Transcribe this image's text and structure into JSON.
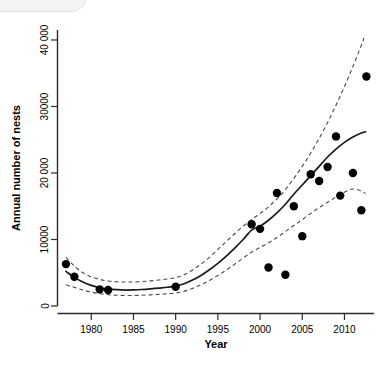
{
  "figure": {
    "background_color": "#ffffff",
    "point_color": "#000000",
    "fit_color": "#1a1a1a",
    "ci_color": "#4a4a4a"
  },
  "artifact": {
    "name": "rounded-overlay-corner",
    "color": "#f4f4f4"
  },
  "chart_data": {
    "type": "scatter",
    "title": "",
    "xlabel": "Year",
    "ylabel": "Annual number of nests",
    "xlim": [
      1976,
      2013.5
    ],
    "ylim": [
      0,
      41500
    ],
    "grid": false,
    "legend": "none",
    "xticks": [
      1980,
      1985,
      1990,
      1995,
      2000,
      2005,
      2010
    ],
    "xticklabels": [
      "1980",
      "1985",
      "1990",
      "1995",
      "2000",
      "2005",
      "2010"
    ],
    "yticks": [
      0,
      10000,
      20000,
      30000,
      40000
    ],
    "yticklabels": [
      "0",
      "10000",
      "20 000",
      "30000",
      "40 000"
    ],
    "series": [
      {
        "name": "Annual number of nests",
        "type": "scatter",
        "marker": "filled-circle",
        "color": "#000000",
        "points": [
          {
            "x": 1977,
            "y": 6300
          },
          {
            "x": 1978,
            "y": 4400
          },
          {
            "x": 1981,
            "y": 2500
          },
          {
            "x": 1982,
            "y": 2400
          },
          {
            "x": 1990,
            "y": 2900
          },
          {
            "x": 1999,
            "y": 12300
          },
          {
            "x": 2000,
            "y": 11600
          },
          {
            "x": 2001,
            "y": 5800
          },
          {
            "x": 2002,
            "y": 17000
          },
          {
            "x": 2003,
            "y": 4700
          },
          {
            "x": 2004,
            "y": 15000
          },
          {
            "x": 2005,
            "y": 10500
          },
          {
            "x": 2006,
            "y": 19800
          },
          {
            "x": 2007,
            "y": 18800
          },
          {
            "x": 2008,
            "y": 20900
          },
          {
            "x": 2009,
            "y": 25500
          },
          {
            "x": 2009.5,
            "y": 16600
          },
          {
            "x": 2011,
            "y": 20000
          },
          {
            "x": 2012,
            "y": 14400
          },
          {
            "x": 2012.6,
            "y": 34500
          }
        ]
      },
      {
        "name": "Fitted trend",
        "type": "line",
        "style": "solid",
        "color": "#1a1a1a",
        "points": [
          {
            "x": 1977,
            "y": 5200
          },
          {
            "x": 1978,
            "y": 4300
          },
          {
            "x": 1979,
            "y": 3600
          },
          {
            "x": 1980,
            "y": 3100
          },
          {
            "x": 1981,
            "y": 2750
          },
          {
            "x": 1982,
            "y": 2550
          },
          {
            "x": 1983,
            "y": 2450
          },
          {
            "x": 1984,
            "y": 2400
          },
          {
            "x": 1985,
            "y": 2420
          },
          {
            "x": 1986,
            "y": 2480
          },
          {
            "x": 1987,
            "y": 2580
          },
          {
            "x": 1988,
            "y": 2700
          },
          {
            "x": 1989,
            "y": 2820
          },
          {
            "x": 1990,
            "y": 3000
          },
          {
            "x": 1991,
            "y": 3350
          },
          {
            "x": 1992,
            "y": 3900
          },
          {
            "x": 1993,
            "y": 4600
          },
          {
            "x": 1994,
            "y": 5450
          },
          {
            "x": 1995,
            "y": 6400
          },
          {
            "x": 1996,
            "y": 7500
          },
          {
            "x": 1997,
            "y": 8700
          },
          {
            "x": 1998,
            "y": 10000
          },
          {
            "x": 1999,
            "y": 11400
          },
          {
            "x": 2000,
            "y": 12000
          },
          {
            "x": 2001,
            "y": 12900
          },
          {
            "x": 2002,
            "y": 14000
          },
          {
            "x": 2003,
            "y": 15300
          },
          {
            "x": 2004,
            "y": 16800
          },
          {
            "x": 2005,
            "y": 18200
          },
          {
            "x": 2006,
            "y": 19600
          },
          {
            "x": 2007,
            "y": 21000
          },
          {
            "x": 2008,
            "y": 22400
          },
          {
            "x": 2009,
            "y": 23600
          },
          {
            "x": 2010,
            "y": 24600
          },
          {
            "x": 2011,
            "y": 25400
          },
          {
            "x": 2012,
            "y": 26000
          },
          {
            "x": 2012.5,
            "y": 26200
          }
        ]
      },
      {
        "name": "Upper confidence band",
        "type": "line",
        "style": "dashed",
        "color": "#4a4a4a",
        "points": [
          {
            "x": 1977,
            "y": 7300
          },
          {
            "x": 1978,
            "y": 6000
          },
          {
            "x": 1979,
            "y": 5000
          },
          {
            "x": 1980,
            "y": 4400
          },
          {
            "x": 1981,
            "y": 4000
          },
          {
            "x": 1982,
            "y": 3750
          },
          {
            "x": 1983,
            "y": 3650
          },
          {
            "x": 1984,
            "y": 3600
          },
          {
            "x": 1985,
            "y": 3620
          },
          {
            "x": 1986,
            "y": 3680
          },
          {
            "x": 1987,
            "y": 3780
          },
          {
            "x": 1988,
            "y": 3900
          },
          {
            "x": 1989,
            "y": 4050
          },
          {
            "x": 1990,
            "y": 4250
          },
          {
            "x": 1991,
            "y": 4700
          },
          {
            "x": 1992,
            "y": 5400
          },
          {
            "x": 1993,
            "y": 6300
          },
          {
            "x": 1994,
            "y": 7300
          },
          {
            "x": 1995,
            "y": 8500
          },
          {
            "x": 1996,
            "y": 9700
          },
          {
            "x": 1997,
            "y": 10900
          },
          {
            "x": 1998,
            "y": 12000
          },
          {
            "x": 1999,
            "y": 13000
          },
          {
            "x": 2000,
            "y": 13900
          },
          {
            "x": 2001,
            "y": 14900
          },
          {
            "x": 2002,
            "y": 16100
          },
          {
            "x": 2003,
            "y": 17500
          },
          {
            "x": 2004,
            "y": 19200
          },
          {
            "x": 2005,
            "y": 21000
          },
          {
            "x": 2006,
            "y": 23000
          },
          {
            "x": 2007,
            "y": 25200
          },
          {
            "x": 2008,
            "y": 27600
          },
          {
            "x": 2009,
            "y": 30200
          },
          {
            "x": 2010,
            "y": 33000
          },
          {
            "x": 2011,
            "y": 36000
          },
          {
            "x": 2012,
            "y": 39200
          },
          {
            "x": 2012.3,
            "y": 40300
          }
        ]
      },
      {
        "name": "Lower confidence band",
        "type": "line",
        "style": "dashed",
        "color": "#4a4a4a",
        "points": [
          {
            "x": 1977,
            "y": 3200
          },
          {
            "x": 1978,
            "y": 2800
          },
          {
            "x": 1979,
            "y": 2400
          },
          {
            "x": 1980,
            "y": 2100
          },
          {
            "x": 1981,
            "y": 1850
          },
          {
            "x": 1982,
            "y": 1700
          },
          {
            "x": 1983,
            "y": 1620
          },
          {
            "x": 1984,
            "y": 1580
          },
          {
            "x": 1985,
            "y": 1580
          },
          {
            "x": 1986,
            "y": 1620
          },
          {
            "x": 1987,
            "y": 1680
          },
          {
            "x": 1988,
            "y": 1750
          },
          {
            "x": 1989,
            "y": 1830
          },
          {
            "x": 1990,
            "y": 1950
          },
          {
            "x": 1991,
            "y": 2200
          },
          {
            "x": 1992,
            "y": 2650
          },
          {
            "x": 1993,
            "y": 3200
          },
          {
            "x": 1994,
            "y": 3850
          },
          {
            "x": 1995,
            "y": 4600
          },
          {
            "x": 1996,
            "y": 5400
          },
          {
            "x": 1997,
            "y": 6300
          },
          {
            "x": 1998,
            "y": 7200
          },
          {
            "x": 1999,
            "y": 8100
          },
          {
            "x": 2000,
            "y": 8800
          },
          {
            "x": 2001,
            "y": 9500
          },
          {
            "x": 2002,
            "y": 10300
          },
          {
            "x": 2003,
            "y": 11200
          },
          {
            "x": 2004,
            "y": 12100
          },
          {
            "x": 2005,
            "y": 13000
          },
          {
            "x": 2006,
            "y": 13900
          },
          {
            "x": 2007,
            "y": 14800
          },
          {
            "x": 2008,
            "y": 15600
          },
          {
            "x": 2009,
            "y": 16400
          },
          {
            "x": 2010,
            "y": 17100
          },
          {
            "x": 2011,
            "y": 17600
          },
          {
            "x": 2012,
            "y": 17300
          },
          {
            "x": 2012.5,
            "y": 16900
          }
        ]
      }
    ]
  }
}
